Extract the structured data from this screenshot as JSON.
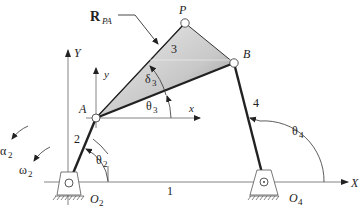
{
  "diagram": {
    "type": "fourbar-linkage",
    "labels": {
      "global_x_axis": "X",
      "global_y_axis": "Y",
      "local_x_axis": "x",
      "local_y_axis": "y",
      "vector_R": "R",
      "vector_R_sub": "PA",
      "point_P": "P",
      "point_A": "A",
      "point_B": "B",
      "pivot_O2": "O",
      "pivot_O2_sub": "2",
      "pivot_O4": "O",
      "pivot_O4_sub": "4",
      "link_1": "1",
      "link_2": "2",
      "link_3": "3",
      "link_4": "4",
      "theta2": "θ",
      "theta2_sub": "2",
      "theta3": "θ",
      "theta3_sub": "3",
      "theta4": "θ",
      "theta4_sub": "4",
      "delta3": "δ",
      "delta3_sub": "3",
      "alpha2": "α",
      "alpha2_sub": "2",
      "omega2": "ω",
      "omega2_sub": "2"
    },
    "colors": {
      "link": "#222222",
      "axis": "#555555",
      "coupler_fill_light": "#e6e6e6",
      "coupler_fill_dark": "#9a9a9a"
    }
  }
}
